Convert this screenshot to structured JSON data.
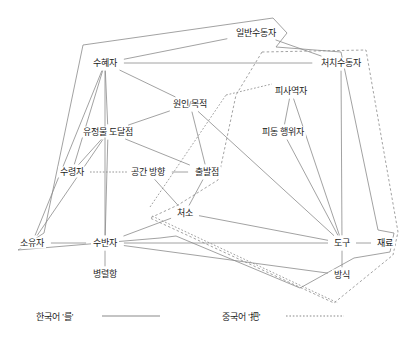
{
  "diagram": {
    "type": "semantic-map",
    "colors": {
      "edge": "#8a8a8a",
      "boundary_solid": "#8a8a8a",
      "boundary_dashed": "#8a8a8a",
      "text": "#1b1b1b",
      "background": "#ffffff"
    },
    "nodes": [
      {
        "id": "ilban_sudongja",
        "label": "일반수동자",
        "x": 256,
        "y": 33
      },
      {
        "id": "suhyeja",
        "label": "수혜자",
        "x": 105,
        "y": 63
      },
      {
        "id": "chichi_sudongja",
        "label": "처치수동자",
        "x": 341,
        "y": 63
      },
      {
        "id": "pisayeokja",
        "label": "피사역자",
        "x": 291,
        "y": 91
      },
      {
        "id": "wonin_mokjeok",
        "label": "원인/목적",
        "x": 190,
        "y": 104
      },
      {
        "id": "pidong_haengwija",
        "label": "피동 행위자",
        "x": 283,
        "y": 132
      },
      {
        "id": "yujeongmul",
        "label": "유정물 도달점",
        "x": 108,
        "y": 132
      },
      {
        "id": "suryeongja",
        "label": "수령자",
        "x": 72,
        "y": 172
      },
      {
        "id": "gonggan_banghyang",
        "label": "공간 방향",
        "x": 148,
        "y": 172
      },
      {
        "id": "chulbaljeom",
        "label": "출발점",
        "x": 207,
        "y": 172
      },
      {
        "id": "cheoso",
        "label": "처소",
        "x": 185,
        "y": 213
      },
      {
        "id": "soyuja",
        "label": "소유자",
        "x": 32,
        "y": 243
      },
      {
        "id": "subanja",
        "label": "수반자",
        "x": 105,
        "y": 243
      },
      {
        "id": "dogu",
        "label": "도구",
        "x": 342,
        "y": 243
      },
      {
        "id": "jaeryo",
        "label": "재료",
        "x": 385,
        "y": 243
      },
      {
        "id": "byeongryeolhang",
        "label": "병렬항",
        "x": 105,
        "y": 274
      },
      {
        "id": "bangsik",
        "label": "방식",
        "x": 342,
        "y": 275
      }
    ],
    "edges": [
      {
        "from": "ilban_sudongja",
        "to": "suhyeja"
      },
      {
        "from": "ilban_sudongja",
        "to": "chichi_sudongja"
      },
      {
        "from": "suhyeja",
        "to": "chichi_sudongja"
      },
      {
        "from": "suhyeja",
        "to": "wonin_mokjeok"
      },
      {
        "from": "suhyeja",
        "to": "yujeongmul"
      },
      {
        "from": "suhyeja",
        "to": "soyuja"
      },
      {
        "from": "suhyeja",
        "to": "suryeongja"
      },
      {
        "from": "suhyeja",
        "to": "subanja"
      },
      {
        "from": "wonin_mokjeok",
        "to": "yujeongmul"
      },
      {
        "from": "wonin_mokjeok",
        "to": "chulbaljeom"
      },
      {
        "from": "wonin_mokjeok",
        "to": "dogu"
      },
      {
        "from": "yujeongmul",
        "to": "suryeongja"
      },
      {
        "from": "yujeongmul",
        "to": "subanja"
      },
      {
        "from": "yujeongmul",
        "to": "chulbaljeom"
      },
      {
        "from": "yujeongmul",
        "to": "soyuja"
      },
      {
        "from": "gonggan_banghyang",
        "to": "chulbaljeom"
      },
      {
        "from": "gonggan_banghyang",
        "to": "cheoso"
      },
      {
        "from": "chulbaljeom",
        "to": "cheoso"
      },
      {
        "from": "cheoso",
        "to": "subanja"
      },
      {
        "from": "cheoso",
        "to": "dogu"
      },
      {
        "from": "soyuja",
        "to": "subanja"
      },
      {
        "from": "subanja",
        "to": "byeongryeolhang"
      },
      {
        "from": "subanja",
        "to": "dogu"
      },
      {
        "from": "subanja",
        "to": "bangsik"
      },
      {
        "from": "dogu",
        "to": "jaeryo"
      },
      {
        "from": "dogu",
        "to": "bangsik"
      },
      {
        "from": "chichi_sudongja",
        "to": "dogu"
      },
      {
        "from": "pisayeokja",
        "to": "pidong_haengwija"
      },
      {
        "from": "pisayeokja",
        "to": "dogu"
      },
      {
        "from": "pidong_haengwija",
        "to": "dogu"
      }
    ],
    "boundaries": [
      {
        "id": "korean-reul-boundary",
        "style": "solid",
        "language": "한국어 '를'"
      },
      {
        "id": "chinese-ba-boundary",
        "style": "dashed",
        "language": "중국어 '把'"
      }
    ]
  },
  "legend": {
    "items": [
      {
        "label": "한국어 '를'",
        "style": "solid",
        "x": 36,
        "y": 316
      },
      {
        "label": "중국어 '把'",
        "style": "dotted",
        "x": 222,
        "y": 316
      }
    ]
  }
}
